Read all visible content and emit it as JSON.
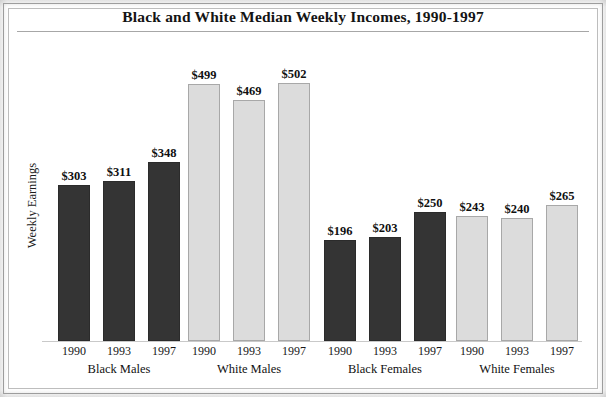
{
  "chart_data": {
    "type": "bar",
    "title": "Black and White Median Weekly Incomes, 1990-1997",
    "xlabel": "",
    "ylabel": "Weekly Earnings",
    "ylim": [
      0,
      560
    ],
    "grid": false,
    "legend": "none",
    "categories": [
      "1990",
      "1993",
      "1997"
    ],
    "groups": [
      {
        "name": "Black Males",
        "fill": "#343434",
        "bars": [
          {
            "year": "1990",
            "value": 303,
            "label": "$303"
          },
          {
            "year": "1993",
            "value": 311,
            "label": "$311"
          },
          {
            "year": "1997",
            "value": 348,
            "label": "$348"
          }
        ]
      },
      {
        "name": "White Males",
        "fill": "#dcdcdc",
        "bars": [
          {
            "year": "1990",
            "value": 499,
            "label": "$499"
          },
          {
            "year": "1993",
            "value": 469,
            "label": "$469"
          },
          {
            "year": "1997",
            "value": 502,
            "label": "$502"
          }
        ]
      },
      {
        "name": "Black Females",
        "fill": "#343434",
        "bars": [
          {
            "year": "1990",
            "value": 196,
            "label": "$196"
          },
          {
            "year": "1993",
            "value": 203,
            "label": "$203"
          },
          {
            "year": "1997",
            "value": 250,
            "label": "$250"
          }
        ]
      },
      {
        "name": "White Females",
        "fill": "#dcdcdc",
        "bars": [
          {
            "year": "1990",
            "value": 243,
            "label": "$243"
          },
          {
            "year": "1993",
            "value": 240,
            "label": "$240"
          },
          {
            "year": "1997",
            "value": 265,
            "label": "$265"
          }
        ]
      }
    ]
  },
  "colors": {
    "dark_bar": "#343434",
    "light_bar": "#dcdcdc",
    "light_bar_border": "#a8a8a8",
    "frame": "#9a9a9a",
    "rule": "#a7a7a7",
    "text": "#111111",
    "background": "#ffffff"
  }
}
